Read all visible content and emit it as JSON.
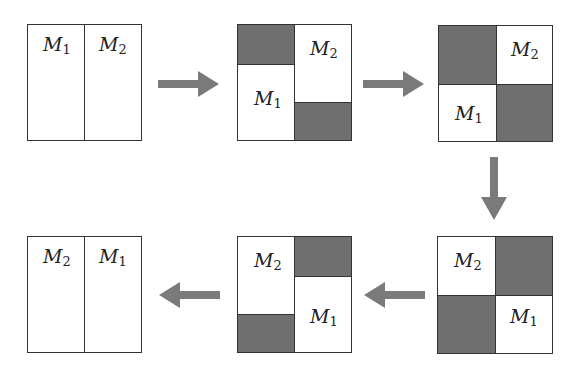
{
  "diagram": {
    "colors": {
      "shade": "#6f6f6f",
      "arrow": "#7a7a7a",
      "border": "#333333"
    },
    "labels": {
      "m1": {
        "base": "M",
        "sub": "1"
      },
      "m2": {
        "base": "M",
        "sub": "2"
      }
    },
    "stages": [
      {
        "id": 1,
        "layout": "M1 | M2 side by side"
      },
      {
        "id": 2,
        "layout": "M1 moving down-left, M2 moving up-right, top-left and bottom-right shaded"
      },
      {
        "id": 3,
        "layout": "M2 top-right, M1 bottom-left, diagonal shaded"
      },
      {
        "id": 4,
        "layout": "M2 top-left, M1 bottom-right, diagonal shaded"
      },
      {
        "id": 5,
        "layout": "M2 moving down-left, M1 moving up-right, top-right and bottom-left shaded"
      },
      {
        "id": 6,
        "layout": "M2 | M1 side by side"
      }
    ],
    "arrows": [
      "right",
      "right",
      "down",
      "left",
      "left"
    ]
  }
}
